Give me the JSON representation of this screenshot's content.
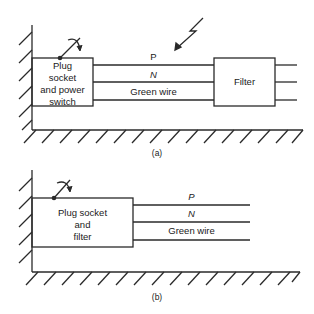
{
  "diagram_a": {
    "caption": "(a)",
    "source_box": {
      "lines": [
        "Plug",
        "socket",
        "and power",
        "switch"
      ]
    },
    "filter_box": {
      "label": "Filter"
    },
    "wires": [
      {
        "label": "P"
      },
      {
        "label": "N"
      },
      {
        "label": "Green wire"
      }
    ],
    "interference_icon": "lightning-arrow-icon",
    "switch_icon": "rotary-switch-icon"
  },
  "diagram_b": {
    "caption": "(b)",
    "source_box": {
      "lines": [
        "Plug socket",
        "and",
        "filter"
      ]
    },
    "wires": [
      {
        "label": "P"
      },
      {
        "label": "N"
      },
      {
        "label": "Green wire"
      }
    ],
    "switch_icon": "rotary-switch-icon"
  },
  "colors": {
    "stroke": "#2a2a2a",
    "background": "#ffffff"
  }
}
